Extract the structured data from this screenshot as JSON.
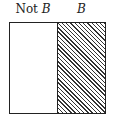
{
  "diagram": {
    "type": "venn-complement",
    "labels": {
      "left_prefix": "Not ",
      "left_var": "B",
      "right": "B"
    },
    "regions": [
      {
        "name": "Not B",
        "fill": "none"
      },
      {
        "name": "B",
        "fill": "diagonal-hatch"
      }
    ],
    "colors": {
      "stroke": "#222222",
      "hatch": "#333333",
      "background": "#ffffff"
    }
  }
}
